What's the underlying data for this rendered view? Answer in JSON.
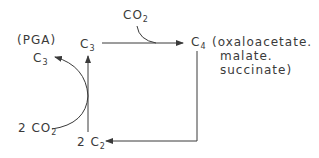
{
  "diagram": {
    "nodes": {
      "pga_label": "(PGA)",
      "c3_left": {
        "base": "C",
        "sub": "3"
      },
      "c3_center": {
        "base": "C",
        "sub": "3"
      },
      "co2_top": {
        "base": "CO",
        "sub": "2"
      },
      "c4": {
        "base": "C",
        "sub": "4"
      },
      "c4_products": [
        "(oxaloacetate.",
        "malate.",
        "succinate)"
      ],
      "two_co2": {
        "base": "2 CO",
        "sub": "2"
      },
      "two_c2": {
        "base": "2 C",
        "sub": "2"
      }
    },
    "edges": [
      {
        "from": "C3 (center)",
        "to": "C4",
        "with": "CO2"
      },
      {
        "from": "C4",
        "to": "2C2"
      },
      {
        "from": "2C2",
        "to": "C3 (center)"
      },
      {
        "from": "2C2 + 2CO2",
        "to": "C3 (PGA)"
      }
    ],
    "colors": {
      "ink": "#3a3a3a",
      "background": "#ffffff"
    }
  }
}
